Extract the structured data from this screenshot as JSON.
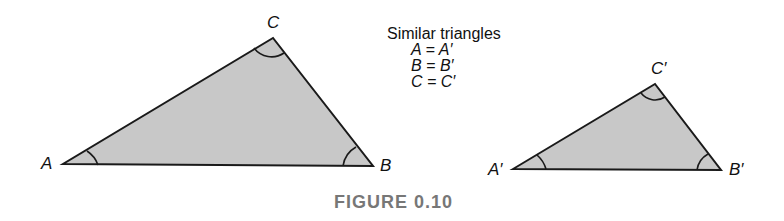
{
  "legend": {
    "title": "Similar triangles",
    "lines": [
      "A = A′",
      "B = B′",
      "C = C′"
    ]
  },
  "triangle_large": {
    "labels": {
      "a": "A",
      "b": "B",
      "c": "C"
    }
  },
  "triangle_small": {
    "labels": {
      "a": "A′",
      "b": "B′",
      "c": "C′"
    }
  },
  "caption": "FIGURE 0.10",
  "colors": {
    "fill": "#c8c8c8",
    "stroke": "#1a1a1a",
    "caption": "#777777"
  }
}
